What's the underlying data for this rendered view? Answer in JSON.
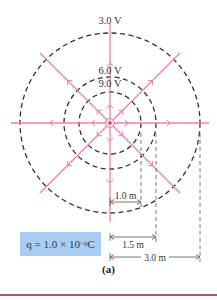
{
  "figure": {
    "center": {
      "x": 110,
      "y": 123
    },
    "field_line_color": "#f07fa5",
    "equipotential_color": "#333333",
    "pixels_per_meter": 30,
    "equipotentials": [
      {
        "label": "3.0 V",
        "radius_m": 3.0,
        "radius_px": 90,
        "label_y": 24
      },
      {
        "label": "6.0 V",
        "radius_m": 1.5,
        "radius_px": 46,
        "label_y": 74
      },
      {
        "label": "9.0 V",
        "radius_m": 1.0,
        "radius_px": 31,
        "label_y": 87
      }
    ],
    "field_lines": {
      "count": 8,
      "angles_deg": [
        0,
        45,
        90,
        135,
        180,
        225,
        270,
        315
      ],
      "direction": "outward",
      "length_px": 99
    },
    "dimensions": [
      {
        "label": "1.0 m",
        "y": 202,
        "x_end": 141
      },
      {
        "label": "1.5 m",
        "y": 237,
        "x_end": 156
      },
      {
        "label": "3.0 m",
        "y": 257,
        "x_end": 200
      }
    ],
    "charge_label": {
      "prefix": "q = 1.0 × 10",
      "exponent": "−9",
      "suffix": " C"
    },
    "caption": "(a)"
  }
}
